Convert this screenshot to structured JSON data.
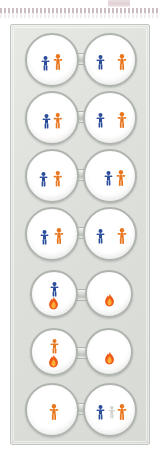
{
  "canvas": {
    "width": 160,
    "height": 471,
    "background": "#ffffff"
  },
  "top_marker": {
    "name": "faded-highlight-mark",
    "color": "#c9a9ae"
  },
  "separator": {
    "name": "dotted-rule",
    "style": "dotted",
    "color": "#b9a8ad"
  },
  "panel": {
    "title": "",
    "background": "#dee1dc",
    "border_color": "#c3c7c1"
  },
  "palette": {
    "blue_figure": "#2a4c9b",
    "orange_figure": "#e8761f",
    "flame": "#f0611a",
    "ghost_figure": "#cfd2cd",
    "bubble_fill": "#ffffff",
    "bubble_stroke": "#b0b4af",
    "connector": "#c9ccc7"
  },
  "rows": [
    {
      "id": "row-1",
      "top": 6,
      "size": "large",
      "left_bubble": {
        "name": "bubble-left-1",
        "items": [
          {
            "icon": "person-blue-icon",
            "color": "blue",
            "x": 14,
            "y": 21,
            "scale": 1.0
          },
          {
            "icon": "person-orange-icon",
            "color": "orange",
            "x": 26,
            "y": 19,
            "scale": 1.1
          }
        ]
      },
      "right_bubble": {
        "name": "bubble-right-1",
        "items": [
          {
            "icon": "person-blue-icon",
            "color": "blue",
            "x": 11,
            "y": 20,
            "scale": 1.0
          },
          {
            "icon": "person-orange-icon",
            "color": "orange",
            "x": 32,
            "y": 19,
            "scale": 1.1
          }
        ]
      }
    },
    {
      "id": "row-2",
      "top": 64,
      "size": "large",
      "left_bubble": {
        "name": "bubble-left-2",
        "items": [
          {
            "icon": "person-blue-icon",
            "color": "blue",
            "x": 15,
            "y": 21,
            "scale": 1.0
          },
          {
            "icon": "person-orange-icon",
            "color": "orange",
            "x": 26,
            "y": 20,
            "scale": 1.05
          }
        ]
      },
      "right_bubble": {
        "name": "bubble-right-2",
        "items": [
          {
            "icon": "person-blue-icon",
            "color": "blue",
            "x": 11,
            "y": 20,
            "scale": 1.0
          },
          {
            "icon": "person-orange-icon",
            "color": "orange",
            "x": 32,
            "y": 19,
            "scale": 1.1
          }
        ]
      }
    },
    {
      "id": "row-3",
      "top": 122,
      "size": "large",
      "left_bubble": {
        "name": "bubble-left-3",
        "items": [
          {
            "icon": "person-blue-icon",
            "color": "blue",
            "x": 12,
            "y": 21,
            "scale": 1.0
          },
          {
            "icon": "person-orange-icon",
            "color": "orange",
            "x": 26,
            "y": 20,
            "scale": 1.05
          }
        ]
      },
      "right_bubble": {
        "name": "bubble-right-3",
        "items": [
          {
            "icon": "person-blue-icon",
            "color": "blue",
            "x": 19,
            "y": 20,
            "scale": 1.0
          },
          {
            "icon": "person-orange-icon",
            "color": "orange",
            "x": 31,
            "y": 19,
            "scale": 1.1
          }
        ]
      }
    },
    {
      "id": "row-4",
      "top": 180,
      "size": "large",
      "left_bubble": {
        "name": "bubble-left-4",
        "items": [
          {
            "icon": "person-blue-icon",
            "color": "blue",
            "x": 13,
            "y": 21,
            "scale": 1.0
          },
          {
            "icon": "person-orange-icon",
            "color": "orange",
            "x": 27,
            "y": 19,
            "scale": 1.1
          }
        ]
      },
      "right_bubble": {
        "name": "bubble-right-4",
        "items": [
          {
            "icon": "person-blue-icon",
            "color": "blue",
            "x": 11,
            "y": 20,
            "scale": 1.0
          },
          {
            "icon": "person-orange-icon",
            "color": "orange",
            "x": 32,
            "y": 19,
            "scale": 1.1
          }
        ]
      }
    },
    {
      "id": "row-5",
      "top": 240,
      "size": "small",
      "left_bubble": {
        "name": "bubble-left-5",
        "items": [
          {
            "icon": "person-blue-icon",
            "color": "blue",
            "x": 18,
            "y": 10,
            "scale": 1.0
          },
          {
            "icon": "flame-icon",
            "color": "flame",
            "x": 16,
            "y": 25,
            "scale": 1.0
          }
        ]
      },
      "right_bubble": {
        "name": "bubble-right-5",
        "items": [
          {
            "icon": "flame-icon",
            "color": "flame",
            "x": 17,
            "y": 22,
            "scale": 1.0
          }
        ]
      }
    },
    {
      "id": "row-6",
      "top": 298,
      "size": "small",
      "left_bubble": {
        "name": "bubble-left-6",
        "items": [
          {
            "icon": "person-orange-icon",
            "color": "orange",
            "x": 18,
            "y": 9,
            "scale": 1.0
          },
          {
            "icon": "flame-icon",
            "color": "flame",
            "x": 16,
            "y": 25,
            "scale": 1.0
          }
        ]
      },
      "right_bubble": {
        "name": "bubble-right-6",
        "items": [
          {
            "icon": "flame-icon",
            "color": "flame",
            "x": 17,
            "y": 22,
            "scale": 1.0
          }
        ]
      }
    },
    {
      "id": "row-7",
      "top": 356,
      "size": "large",
      "left_bubble": {
        "name": "bubble-left-7",
        "items": [
          {
            "icon": "person-orange-icon",
            "color": "orange",
            "x": 22,
            "y": 19,
            "scale": 1.1
          }
        ]
      },
      "right_bubble": {
        "name": "bubble-right-7",
        "items": [
          {
            "icon": "person-blue-icon",
            "color": "blue",
            "x": 11,
            "y": 20,
            "scale": 1.0
          },
          {
            "icon": "person-faded-icon",
            "color": "ghost",
            "x": 23,
            "y": 21,
            "scale": 0.85
          },
          {
            "icon": "person-orange-icon",
            "color": "orange",
            "x": 32,
            "y": 19,
            "scale": 1.1
          }
        ]
      }
    }
  ]
}
